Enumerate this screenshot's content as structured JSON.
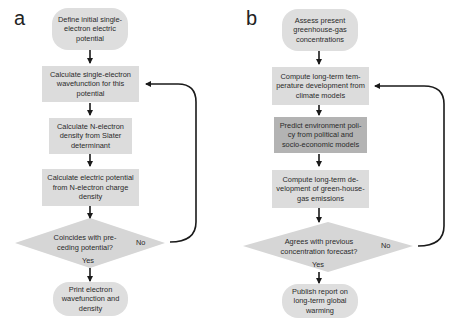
{
  "panels": [
    {
      "label": "a",
      "start": "Define initial single-electron electric potential",
      "steps": [
        "Calculate single-electron wavefunction for this potential",
        "Calculate N-electron density from Slater determinant",
        "Calculate electric potential from N-electron charge density"
      ],
      "decision": "Coincides with pre-ceding potential?",
      "yes_label": "Yes",
      "no_label": "No",
      "end": "Print electron wavefunction and density"
    },
    {
      "label": "b",
      "start": "Assess present greenhouse-gas concentrations",
      "steps": [
        "Compute long-term tem-perature development from climate models",
        "Predict environment poli-cy from political and socio-economic models",
        "Compute long-term de-velopment of green-house-gas emissions"
      ],
      "decision": "Agrees with previous concentration forecast?",
      "yes_label": "Yes",
      "no_label": "No",
      "end": "Publish report on long-term global warming"
    }
  ],
  "colors": {
    "process_fill": "#dcdcdc",
    "highlight_fill": "#b3b3b3",
    "terminal_fill": "#dedede",
    "decision_fill": "#d6d6d6",
    "arrow": "#1a1a1a"
  }
}
